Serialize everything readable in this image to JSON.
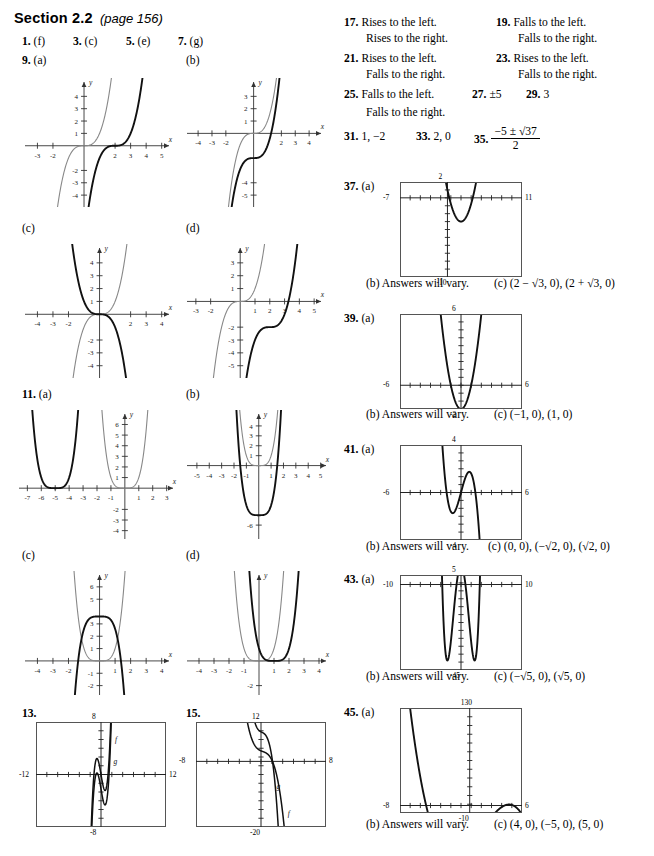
{
  "header": {
    "section": "Section 2.2",
    "page_ref": "(page 156)"
  },
  "left": {
    "row1": [
      {
        "num": "1.",
        "ans": "(f)"
      },
      {
        "num": "3.",
        "ans": "(c)"
      },
      {
        "num": "5.",
        "ans": "(e)"
      },
      {
        "num": "7.",
        "ans": "(g)"
      }
    ],
    "p9": {
      "num": "9.",
      "parts": [
        "(a)",
        "(b)",
        "(c)",
        "(d)"
      ]
    },
    "p11": {
      "num": "11.",
      "parts": [
        "(a)",
        "(b)",
        "(c)",
        "(d)"
      ]
    },
    "p13": {
      "num": "13."
    },
    "p15": {
      "num": "15."
    }
  },
  "right": {
    "p17": {
      "num": "17.",
      "line1": "Rises to the left.",
      "line2": "Rises to the right."
    },
    "p19": {
      "num": "19.",
      "line1": "Falls to the left.",
      "line2": "Falls to the right."
    },
    "p21": {
      "num": "21.",
      "line1": "Rises to the left.",
      "line2": "Falls to the right."
    },
    "p23": {
      "num": "23.",
      "line1": "Rises to the left.",
      "line2": "Falls to the right."
    },
    "p25": {
      "num": "25.",
      "line1": "Falls to the left.",
      "line2": "Falls to the right."
    },
    "p27": {
      "num": "27.",
      "ans": "±5"
    },
    "p29": {
      "num": "29.",
      "ans": "3"
    },
    "p31": {
      "num": "31.",
      "ans": "1, −2"
    },
    "p33": {
      "num": "33.",
      "ans": "2, 0"
    },
    "p35": {
      "num": "35.",
      "num_top": "−5 ± √37",
      "num_bot": "2"
    },
    "p37": {
      "num": "37.",
      "a": "(a)",
      "b_tag": "(b)",
      "b": "Answers will vary.",
      "c_tag": "(c)",
      "c": "(2 − √3, 0), (2 + √3, 0)"
    },
    "p39": {
      "num": "39.",
      "a": "(a)",
      "b_tag": "(b)",
      "b": "Answers will vary.",
      "c_tag": "(c)",
      "c": "(−1, 0), (1, 0)"
    },
    "p41": {
      "num": "41.",
      "a": "(a)",
      "b_tag": "(b)",
      "b": "Answers will vary.",
      "c_tag": "(c)",
      "c": "(0, 0), (−√2, 0), (√2, 0)"
    },
    "p43": {
      "num": "43.",
      "a": "(a)",
      "b_tag": "(b)",
      "b": "Answers will vary.",
      "c_tag": "(c)",
      "c": "(−√5, 0), (√5, 0)"
    },
    "p45": {
      "num": "45.",
      "a": "(a)",
      "b_tag": "(b)",
      "b": "Answers will vary.",
      "c_tag": "(c)",
      "c": "(4, 0), (−5, 0), (5, 0)"
    }
  },
  "chart_data": [
    {
      "id": "g9a",
      "type": "line",
      "style": "cartesian",
      "xlim": [
        -3.8,
        5.6
      ],
      "ylim": [
        -4.8,
        5.0
      ],
      "xticks": [
        -3,
        -2,
        2,
        3,
        4,
        5
      ],
      "yticks": [
        -4,
        -3,
        -2,
        1,
        2,
        3,
        4
      ],
      "xlabel": "x",
      "ylabel": "y",
      "series": [
        {
          "name": "f",
          "color": "#888888",
          "kind": "cubic",
          "h": 0,
          "k": 0,
          "a": 1
        },
        {
          "name": "shift",
          "color": "#111111",
          "kind": "cubic",
          "h": 2,
          "k": 0,
          "a": 1
        }
      ]
    },
    {
      "id": "g9b",
      "type": "line",
      "style": "cartesian",
      "xlim": [
        -4.8,
        5.0
      ],
      "ylim": [
        -5.8,
        4.0
      ],
      "xticks": [
        -4,
        -3,
        -2,
        2,
        3,
        4
      ],
      "yticks": [
        -5,
        -4,
        1,
        2,
        3
      ],
      "xlabel": "x",
      "ylabel": "y",
      "series": [
        {
          "name": "f",
          "color": "#888888",
          "kind": "cubic",
          "h": 0,
          "k": 0,
          "a": 1
        },
        {
          "name": "shift",
          "color": "#111111",
          "kind": "cubic",
          "h": 0,
          "k": -2,
          "a": 1
        }
      ]
    },
    {
      "id": "g9c",
      "type": "line",
      "style": "cartesian",
      "xlim": [
        -4.8,
        4.6
      ],
      "ylim": [
        -4.8,
        5.0
      ],
      "xticks": [
        -4,
        -3,
        -2,
        2,
        3,
        4
      ],
      "yticks": [
        -4,
        -3,
        -2,
        1,
        2,
        3,
        4
      ],
      "xlabel": "x",
      "ylabel": "y",
      "series": [
        {
          "name": "f",
          "color": "#888888",
          "kind": "cubic",
          "h": 0,
          "k": 0,
          "a": 1
        },
        {
          "name": "reflect",
          "color": "#111111",
          "kind": "cubic",
          "h": 0,
          "k": 0,
          "a": -1
        }
      ]
    },
    {
      "id": "g9d",
      "type": "line",
      "style": "cartesian",
      "xlim": [
        -3.6,
        5.6
      ],
      "ylim": [
        -5.8,
        4.0
      ],
      "xticks": [
        -3,
        -2,
        1,
        2,
        3,
        4,
        5
      ],
      "yticks": [
        -5,
        -4,
        -3,
        -2,
        1,
        2,
        3
      ],
      "xlabel": "x",
      "ylabel": "y",
      "series": [
        {
          "name": "f",
          "color": "#888888",
          "kind": "cubic",
          "h": 0,
          "k": 0,
          "a": 1
        },
        {
          "name": "shift",
          "color": "#111111",
          "kind": "cubic",
          "h": 2,
          "k": -2,
          "a": 1
        }
      ]
    },
    {
      "id": "g11a",
      "type": "line",
      "style": "cartesian",
      "xlim": [
        -7.6,
        3.6
      ],
      "ylim": [
        -4.6,
        6.8
      ],
      "xticks": [
        -7,
        -6,
        -5,
        -4,
        -3,
        -2,
        -1,
        1,
        2,
        3
      ],
      "yticks": [
        -4,
        -3,
        -2,
        1,
        2,
        3,
        4,
        5,
        6
      ],
      "xlabel": "x",
      "ylabel": "y",
      "series": [
        {
          "name": "f",
          "color": "#888888",
          "kind": "quartic",
          "h": 0,
          "k": 0,
          "a": 1
        },
        {
          "name": "shift",
          "color": "#111111",
          "kind": "quartic",
          "h": -5,
          "k": 0,
          "a": 1
        }
      ]
    },
    {
      "id": "g11b",
      "type": "line",
      "style": "cartesian",
      "xlim": [
        -5.8,
        5.6
      ],
      "ylim": [
        -7.2,
        5.0
      ],
      "xticks": [
        -5,
        -4,
        -3,
        -2,
        -1,
        1,
        2,
        3,
        4,
        5
      ],
      "yticks": [
        -6,
        1,
        2,
        3,
        4
      ],
      "xlabel": "x",
      "ylabel": "y",
      "series": [
        {
          "name": "f",
          "color": "#888888",
          "kind": "quartic",
          "h": 0,
          "k": 0,
          "a": 1
        },
        {
          "name": "shift",
          "color": "#111111",
          "kind": "quartic",
          "h": 0,
          "k": -5,
          "a": 1
        }
      ]
    },
    {
      "id": "g11c",
      "type": "line",
      "style": "cartesian",
      "xlim": [
        -4.8,
        4.6
      ],
      "ylim": [
        -2.6,
        6.8
      ],
      "xticks": [
        -4,
        -3,
        -2,
        1,
        2,
        3,
        4
      ],
      "yticks": [
        -1,
        -2,
        1,
        2,
        3,
        5,
        6
      ],
      "xlabel": "x",
      "ylabel": "y",
      "series": [
        {
          "name": "f",
          "color": "#888888",
          "kind": "quartic",
          "h": 0,
          "k": 0,
          "a": 1
        },
        {
          "name": "reflect",
          "color": "#111111",
          "kind": "quartic",
          "h": 0,
          "k": 3.6,
          "a": -1
        }
      ]
    },
    {
      "id": "g11d",
      "type": "line",
      "style": "cartesian",
      "xlim": [
        -4.8,
        4.6
      ],
      "ylim": [
        -2.6,
        6.8
      ],
      "xticks": [
        -4,
        -3,
        -2,
        -1,
        1,
        2,
        3,
        4
      ],
      "yticks": [
        -2
      ],
      "xlabel": "x",
      "ylabel": "y",
      "series": [
        {
          "name": "f",
          "color": "#888888",
          "kind": "quartic",
          "h": 0,
          "k": 0,
          "a": 1
        },
        {
          "name": "shift",
          "color": "#111111",
          "kind": "quartic",
          "h": 1,
          "k": 0,
          "a": 1
        }
      ]
    },
    {
      "id": "g13",
      "type": "line",
      "style": "calculator",
      "xlim": [
        -12,
        12
      ],
      "ylim": [
        -8,
        8
      ],
      "labels": {
        "left": "-12",
        "right": "12",
        "top": "8",
        "bottom": "-8"
      },
      "annotations": [
        {
          "text": "f",
          "x": 2.6,
          "y": 5.0
        },
        {
          "text": "g",
          "x": 2.3,
          "y": 1.6
        }
      ]
    },
    {
      "id": "g15",
      "type": "line",
      "style": "calculator",
      "xlim": [
        -8,
        8
      ],
      "ylim": [
        -20,
        12
      ],
      "labels": {
        "left": "-8",
        "right": "8",
        "top": "12",
        "bottom": "-20"
      },
      "annotations": [
        {
          "text": "g",
          "x": 1.9,
          "y": -8.5
        },
        {
          "text": "f",
          "x": 3.3,
          "y": -16.5
        }
      ]
    },
    {
      "id": "g37",
      "type": "line",
      "style": "calculator",
      "xlim": [
        -7,
        11
      ],
      "ylim": [
        -10,
        2
      ],
      "labels": {
        "left": "-7",
        "right": "11",
        "top": "2",
        "bottom": "-10"
      },
      "roots": [
        0.268,
        3.732
      ],
      "vertex": [
        2,
        -3
      ]
    },
    {
      "id": "g39",
      "type": "line",
      "style": "calculator",
      "xlim": [
        -6,
        6
      ],
      "ylim": [
        -2,
        6
      ],
      "labels": {
        "left": "-6",
        "right": "6",
        "top": "6",
        "bottom": "-2"
      },
      "roots": [
        -1,
        1
      ],
      "vertex": [
        0,
        -0.4
      ]
    },
    {
      "id": "g41",
      "type": "line",
      "style": "calculator",
      "xlim": [
        -6,
        6
      ],
      "ylim": [
        -4,
        4
      ],
      "labels": {
        "left": "-6",
        "right": "6",
        "top": "4",
        "bottom": "-4"
      },
      "roots": [
        -1.414,
        0,
        1.414
      ]
    },
    {
      "id": "g43",
      "type": "line",
      "style": "calculator",
      "xlim": [
        -10,
        10
      ],
      "ylim": [
        -45,
        5
      ],
      "labels": {
        "left": "-10",
        "right": "10",
        "top": "5",
        "bottom": "-45"
      },
      "roots": [
        -2.236,
        2.236
      ],
      "vertex": [
        0,
        -40
      ]
    },
    {
      "id": "g45",
      "type": "line",
      "style": "calculator",
      "xlim": [
        -8,
        6
      ],
      "ylim": [
        -10,
        130
      ],
      "labels": {
        "left": "-8",
        "right": "6",
        "top": "130",
        "bottom": "-10"
      },
      "roots": [
        -5,
        4,
        5
      ]
    }
  ]
}
